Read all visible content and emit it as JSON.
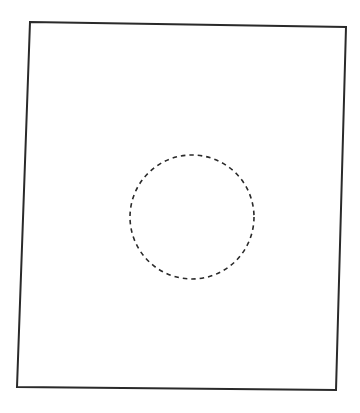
{
  "diagram": {
    "background": "#ffffff",
    "stroke_color": "#2a2a2a",
    "frame": {
      "shape": "quadrilateral",
      "points": [
        [
          30,
          22
        ],
        [
          346,
          27
        ],
        [
          336,
          390
        ],
        [
          17,
          387
        ]
      ],
      "stroke_width": 2,
      "line_style": "solid"
    },
    "circle": {
      "cx": 192,
      "cy": 217,
      "r": 62,
      "stroke_width": 1.6,
      "line_style": "dashed",
      "dash": "4.5 4"
    }
  }
}
